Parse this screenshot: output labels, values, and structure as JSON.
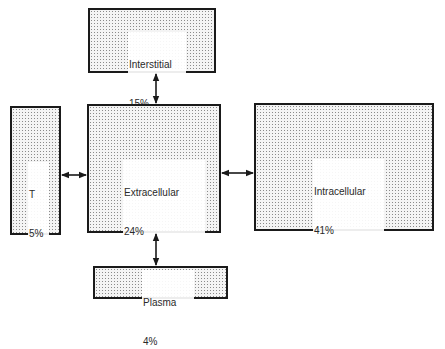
{
  "diagram": {
    "type": "block-diagram",
    "compartments": {
      "interstitial": {
        "name": "Interstitial",
        "percent": "15%"
      },
      "transcellular": {
        "name": "T",
        "percent": "5%"
      },
      "extracellular": {
        "name": "Extracellular",
        "percent": "24%"
      },
      "intracellular": {
        "name": "Intracellular",
        "percent": "41%"
      },
      "plasma": {
        "name": "Plasma",
        "percent": "4%"
      }
    },
    "connections": [
      {
        "from": "extracellular",
        "to": "interstitial",
        "direction": "bidirectional"
      },
      {
        "from": "extracellular",
        "to": "transcellular",
        "direction": "bidirectional"
      },
      {
        "from": "extracellular",
        "to": "intracellular",
        "direction": "bidirectional"
      },
      {
        "from": "extracellular",
        "to": "plasma",
        "direction": "bidirectional"
      }
    ],
    "colors": {
      "border": "#1a1a1a",
      "fill": "#f4f4f4",
      "stipple": "#8a8a8a",
      "arrow": "#1a1a1a"
    }
  }
}
